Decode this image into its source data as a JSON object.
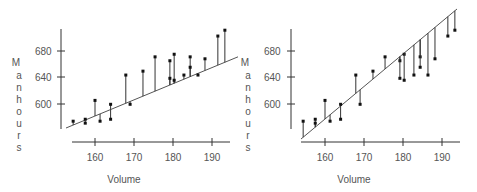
{
  "chart_data": [
    {
      "type": "scatter",
      "title": "",
      "xlabel": "Volume",
      "ylabel": "Manhours",
      "xticks": [
        160,
        170,
        180,
        190
      ],
      "yticks": [
        600,
        640,
        680
      ],
      "xlim": [
        152,
        196
      ],
      "ylim": [
        560,
        720
      ],
      "grid": false,
      "legend": null,
      "annotation": "Vertical residual lines from each point to a shallow fitted line",
      "points": [
        {
          "x": 154.4,
          "y": 572
        },
        {
          "x": 157.5,
          "y": 575
        },
        {
          "x": 157.5,
          "y": 569
        },
        {
          "x": 160,
          "y": 604
        },
        {
          "x": 161.3,
          "y": 572
        },
        {
          "x": 164,
          "y": 598
        },
        {
          "x": 164,
          "y": 575
        },
        {
          "x": 167.9,
          "y": 643
        },
        {
          "x": 169,
          "y": 598
        },
        {
          "x": 172.3,
          "y": 649
        },
        {
          "x": 175.4,
          "y": 671
        },
        {
          "x": 179.2,
          "y": 665
        },
        {
          "x": 179.2,
          "y": 638
        },
        {
          "x": 180.3,
          "y": 675
        },
        {
          "x": 180.3,
          "y": 635
        },
        {
          "x": 182.8,
          "y": 643
        },
        {
          "x": 184.4,
          "y": 671
        },
        {
          "x": 184.4,
          "y": 655
        },
        {
          "x": 186.4,
          "y": 643
        },
        {
          "x": 188.2,
          "y": 668
        },
        {
          "x": 191.5,
          "y": 703
        },
        {
          "x": 193.3,
          "y": 712
        }
      ],
      "fit_line": {
        "x0": 154,
        "y0": 571,
        "x1": 196,
        "y1": 671
      }
    },
    {
      "type": "scatter",
      "title": "",
      "xlabel": "Volume",
      "ylabel": "Manhours",
      "xticks": [
        160,
        170,
        180,
        190
      ],
      "yticks": [
        600,
        640,
        680
      ],
      "xlim": [
        152,
        196
      ],
      "ylim": [
        560,
        720
      ],
      "grid": false,
      "legend": null,
      "annotation": "Vertical residual lines from each point to a steep fitted line",
      "points": [
        {
          "x": 154.4,
          "y": 572
        },
        {
          "x": 157.5,
          "y": 575
        },
        {
          "x": 157.5,
          "y": 569
        },
        {
          "x": 160,
          "y": 604
        },
        {
          "x": 161.3,
          "y": 572
        },
        {
          "x": 164,
          "y": 598
        },
        {
          "x": 164,
          "y": 575
        },
        {
          "x": 167.9,
          "y": 643
        },
        {
          "x": 169,
          "y": 598
        },
        {
          "x": 172.3,
          "y": 649
        },
        {
          "x": 175.4,
          "y": 671
        },
        {
          "x": 179.2,
          "y": 665
        },
        {
          "x": 179.2,
          "y": 638
        },
        {
          "x": 180.3,
          "y": 675
        },
        {
          "x": 180.3,
          "y": 635
        },
        {
          "x": 182.8,
          "y": 643
        },
        {
          "x": 184.4,
          "y": 671
        },
        {
          "x": 184.4,
          "y": 655
        },
        {
          "x": 186.4,
          "y": 643
        },
        {
          "x": 188.2,
          "y": 668
        },
        {
          "x": 191.5,
          "y": 703
        },
        {
          "x": 193.3,
          "y": 712
        }
      ],
      "fit_line": {
        "x0": 154,
        "y0": 550,
        "x1": 194,
        "y1": 750
      }
    }
  ],
  "labels": {
    "left": {
      "xlabel": "Volume",
      "ylabel_letters": [
        "M",
        "a",
        "n",
        "h",
        "o",
        "u",
        "r",
        "s"
      ],
      "xticks": [
        "160",
        "170",
        "180",
        "190"
      ],
      "yticks": [
        "680",
        "640",
        "600"
      ]
    },
    "right": {
      "xlabel": "Volume",
      "ylabel_letters": [
        "M",
        "a",
        "n",
        "h",
        "o",
        "u",
        "r",
        "s"
      ],
      "xticks": [
        "160",
        "170",
        "180",
        "190"
      ],
      "yticks": [
        "680",
        "640",
        "600"
      ]
    }
  }
}
